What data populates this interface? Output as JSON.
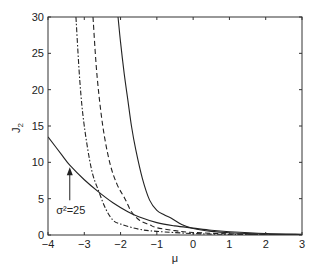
{
  "chart_data": {
    "type": "line",
    "title": "",
    "xlabel": "μ",
    "ylabel": "J",
    "ylabel_subscript": "2",
    "xlim": [
      -4,
      3
    ],
    "ylim": [
      0,
      30
    ],
    "xticks": [
      -4,
      -3,
      -2,
      -1,
      0,
      1,
      2,
      3
    ],
    "yticks": [
      0,
      5,
      10,
      15,
      20,
      25,
      30
    ],
    "grid": false,
    "legend": null,
    "annotations": [
      {
        "text": "σ²=25",
        "x": -3.4,
        "y": 3.4,
        "arrow_to": {
          "x": -3.4,
          "y": 9.6
        }
      }
    ],
    "series": [
      {
        "name": "σ²=25",
        "style": "solid",
        "x": [
          -4.0,
          -3.6,
          -3.4,
          -3.0,
          -2.6,
          -2.2,
          -1.8,
          -1.5,
          -1.0,
          -0.5,
          0.0,
          0.5,
          1.0,
          2.0,
          3.0
        ],
        "y": [
          13.5,
          10.9,
          9.6,
          7.6,
          5.9,
          4.4,
          3.2,
          2.5,
          1.7,
          1.25,
          0.95,
          0.65,
          0.45,
          0.2,
          0.1
        ]
      },
      {
        "name": "steep-solid",
        "style": "solid",
        "x": [
          -2.07,
          -2.0,
          -1.9,
          -1.8,
          -1.7,
          -1.58,
          -1.4,
          -1.2,
          -1.0,
          -0.8,
          -0.6,
          -0.3,
          0.0,
          0.5,
          1.0,
          2.0,
          3.0
        ],
        "y": [
          30,
          26.5,
          22.2,
          18.6,
          15.0,
          11.7,
          7.8,
          4.8,
          3.4,
          2.8,
          2.3,
          1.4,
          0.9,
          0.5,
          0.3,
          0.12,
          0.05
        ]
      },
      {
        "name": "dashed",
        "style": "dashed",
        "x": [
          -2.76,
          -2.65,
          -2.49,
          -2.3,
          -2.1,
          -1.88,
          -1.7,
          -1.47,
          -1.2,
          -1.0,
          -0.5,
          0.0,
          1.0,
          2.0,
          3.0
        ],
        "y": [
          30,
          22.0,
          15.0,
          10.0,
          7.0,
          5.0,
          3.2,
          2.0,
          1.4,
          1.0,
          0.6,
          0.35,
          0.15,
          0.06,
          0.03
        ]
      },
      {
        "name": "dash-dot",
        "style": "dashdot",
        "x": [
          -3.23,
          -3.12,
          -3.0,
          -2.8,
          -2.6,
          -2.4,
          -2.2,
          -2.0,
          -1.5,
          -1.0,
          0.0,
          1.0,
          2.0,
          3.0
        ],
        "y": [
          30,
          21.0,
          15.0,
          9.0,
          6.0,
          3.5,
          2.0,
          1.5,
          0.8,
          0.5,
          0.2,
          0.08,
          0.04,
          0.02
        ]
      }
    ]
  },
  "layout": {
    "plot_left": 48,
    "plot_right": 302,
    "plot_top": 17,
    "plot_bottom": 235,
    "line_color": "#222222",
    "axis_color": "#333333"
  }
}
